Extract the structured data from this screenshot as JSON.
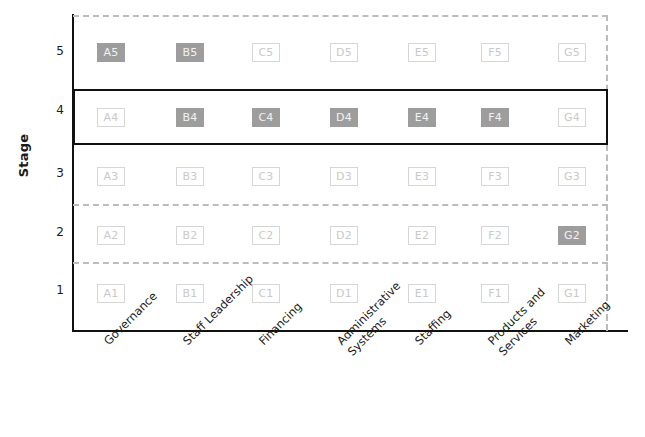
{
  "chart_data": {
    "type": "heatmap",
    "title": "",
    "xlabel": "",
    "ylabel": "Stage",
    "ylim": [
      1,
      5
    ],
    "grid": true,
    "legend_position": "none",
    "categories": [
      "Governance",
      "Staff Leadership",
      "Financing",
      "Administrative Systems",
      "Staffing",
      "Products and Services",
      "Marketing"
    ],
    "category_lines": [
      [
        "Governance"
      ],
      [
        "Staff Leadership"
      ],
      [
        "Financing"
      ],
      [
        "Administrative",
        "Systems"
      ],
      [
        "Staffing"
      ],
      [
        "Products and",
        "Services"
      ],
      [
        "Marketing"
      ]
    ],
    "category_keys": [
      "A",
      "B",
      "C",
      "D",
      "E",
      "F",
      "G"
    ],
    "stages": [
      5,
      4,
      3,
      2,
      1
    ],
    "y_tick_labels": [
      "5",
      "4",
      "3",
      "2",
      "1"
    ],
    "highlighted_stage": 4,
    "colors": {
      "filled": "#9d9d9d",
      "filled_text": "#f2f2f2",
      "empty_fill": "#ffffff",
      "empty_border": "#d6d6d6",
      "empty_text": "#c9c9c9",
      "axis": "#111111",
      "dashed_guide": "#bcbcbc",
      "highlight_border": "#111111",
      "text": "#1a1a1a"
    },
    "cells": [
      {
        "id": "A5",
        "category": "Governance",
        "stage": 5,
        "filled": true
      },
      {
        "id": "B5",
        "category": "Staff Leadership",
        "stage": 5,
        "filled": true
      },
      {
        "id": "C5",
        "category": "Financing",
        "stage": 5,
        "filled": false
      },
      {
        "id": "D5",
        "category": "Administrative Systems",
        "stage": 5,
        "filled": false
      },
      {
        "id": "E5",
        "category": "Staffing",
        "stage": 5,
        "filled": false
      },
      {
        "id": "F5",
        "category": "Products and Services",
        "stage": 5,
        "filled": false
      },
      {
        "id": "G5",
        "category": "Marketing",
        "stage": 5,
        "filled": false
      },
      {
        "id": "A4",
        "category": "Governance",
        "stage": 4,
        "filled": false
      },
      {
        "id": "B4",
        "category": "Staff Leadership",
        "stage": 4,
        "filled": true
      },
      {
        "id": "C4",
        "category": "Financing",
        "stage": 4,
        "filled": true
      },
      {
        "id": "D4",
        "category": "Administrative Systems",
        "stage": 4,
        "filled": true
      },
      {
        "id": "E4",
        "category": "Staffing",
        "stage": 4,
        "filled": true
      },
      {
        "id": "F4",
        "category": "Products and Services",
        "stage": 4,
        "filled": true
      },
      {
        "id": "G4",
        "category": "Marketing",
        "stage": 4,
        "filled": false
      },
      {
        "id": "A3",
        "category": "Governance",
        "stage": 3,
        "filled": false
      },
      {
        "id": "B3",
        "category": "Staff Leadership",
        "stage": 3,
        "filled": false
      },
      {
        "id": "C3",
        "category": "Financing",
        "stage": 3,
        "filled": false
      },
      {
        "id": "D3",
        "category": "Administrative Systems",
        "stage": 3,
        "filled": false
      },
      {
        "id": "E3",
        "category": "Staffing",
        "stage": 3,
        "filled": false
      },
      {
        "id": "F3",
        "category": "Products and Services",
        "stage": 3,
        "filled": false
      },
      {
        "id": "G3",
        "category": "Marketing",
        "stage": 3,
        "filled": false
      },
      {
        "id": "A2",
        "category": "Governance",
        "stage": 2,
        "filled": false
      },
      {
        "id": "B2",
        "category": "Staff Leadership",
        "stage": 2,
        "filled": false
      },
      {
        "id": "C2",
        "category": "Financing",
        "stage": 2,
        "filled": false
      },
      {
        "id": "D2",
        "category": "Administrative Systems",
        "stage": 2,
        "filled": false
      },
      {
        "id": "E2",
        "category": "Staffing",
        "stage": 2,
        "filled": false
      },
      {
        "id": "F2",
        "category": "Products and Services",
        "stage": 2,
        "filled": false
      },
      {
        "id": "G2",
        "category": "Marketing",
        "stage": 2,
        "filled": true
      },
      {
        "id": "A1",
        "category": "Governance",
        "stage": 1,
        "filled": false
      },
      {
        "id": "B1",
        "category": "Staff Leadership",
        "stage": 1,
        "filled": false
      },
      {
        "id": "C1",
        "category": "Financing",
        "stage": 1,
        "filled": false
      },
      {
        "id": "D1",
        "category": "Administrative Systems",
        "stage": 1,
        "filled": false
      },
      {
        "id": "E1",
        "category": "Staffing",
        "stage": 1,
        "filled": false
      },
      {
        "id": "F1",
        "category": "Products and Services",
        "stage": 1,
        "filled": false
      },
      {
        "id": "G1",
        "category": "Marketing",
        "stage": 1,
        "filled": false
      }
    ],
    "selected_stage_per_category": {
      "Governance": 5,
      "Staff Leadership": 5,
      "Financing": 4,
      "Administrative Systems": 4,
      "Staffing": 4,
      "Products and Services": 4,
      "Marketing": 2
    }
  }
}
